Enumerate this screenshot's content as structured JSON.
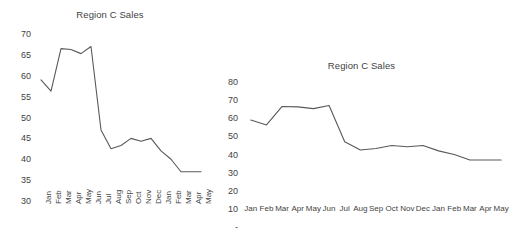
{
  "chart_data": [
    {
      "id": "left",
      "type": "line",
      "title": "Region C Sales",
      "xlabel": "",
      "ylabel": "",
      "categories": [
        "Jan",
        "Feb",
        "Mar",
        "Apr",
        "May",
        "Jun",
        "Jul",
        "Aug",
        "Sep",
        "Oct",
        "Nov",
        "Dec",
        "Jan",
        "Feb",
        "Mar",
        "Apr",
        "May"
      ],
      "values": [
        59.0,
        56.3,
        66.5,
        66.3,
        65.3,
        67.0,
        47.0,
        42.5,
        43.3,
        45.0,
        44.3,
        45.0,
        42.0,
        40.0,
        37.0,
        37.0,
        37.0
      ],
      "ylim": [
        30,
        70
      ],
      "yticks": [
        30,
        35,
        40,
        45,
        50,
        55,
        60,
        65,
        70
      ],
      "ytick_labels": [
        "30",
        "35",
        "40",
        "45",
        "50",
        "55",
        "60",
        "65",
        "70"
      ],
      "xtick_rotation": -90,
      "grid": false,
      "legend": false,
      "series_color": "#595959"
    },
    {
      "id": "right",
      "type": "line",
      "title": "Region C Sales",
      "xlabel": "",
      "ylabel": "",
      "categories": [
        "Jan",
        "Feb",
        "Mar",
        "Apr",
        "May",
        "Jun",
        "Jul",
        "Aug",
        "Sep",
        "Oct",
        "Nov",
        "Dec",
        "Jan",
        "Feb",
        "Mar",
        "Apr",
        "May"
      ],
      "values": [
        59.0,
        56.3,
        66.5,
        66.3,
        65.3,
        67.0,
        47.0,
        42.5,
        43.3,
        45.0,
        44.3,
        45.0,
        42.0,
        40.0,
        37.0,
        37.0,
        37.0
      ],
      "ylim": [
        0,
        80
      ],
      "yticks": [
        0,
        10,
        20,
        30,
        40,
        50,
        60,
        70,
        80
      ],
      "ytick_labels": [
        "-",
        "10",
        "20",
        "30",
        "40",
        "50",
        "60",
        "70",
        "80"
      ],
      "xtick_rotation": 0,
      "grid": false,
      "legend": false,
      "series_color": "#595959"
    }
  ]
}
